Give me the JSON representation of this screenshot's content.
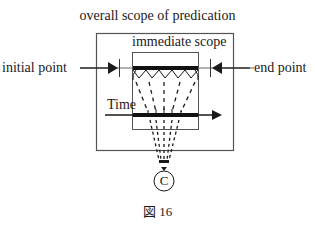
{
  "diagram": {
    "title": "overall scope of predication",
    "immediate_scope_label": "immediate scope",
    "initial_point_label": "initial point",
    "end_point_label": "end point",
    "time_label": "Time",
    "conceptualizer_label": "C",
    "caption": "図 16"
  },
  "colors": {
    "stroke": "#1a1a1a",
    "box_stroke": "#555555",
    "background": "#ffffff"
  }
}
